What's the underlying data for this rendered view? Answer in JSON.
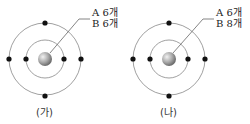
{
  "diagrams": [
    {
      "caption": "(가)",
      "labels": [
        {
          "particle": "A",
          "count": "6개"
        },
        {
          "particle": "B",
          "count": "6개"
        }
      ]
    },
    {
      "caption": "(나)",
      "labels": [
        {
          "particle": "A",
          "count": "6개"
        },
        {
          "particle": "B",
          "count": "8개"
        }
      ]
    }
  ],
  "colors": {
    "orbit": "#888888",
    "electron": "#111111",
    "nucleus": "#9a9a9a"
  }
}
